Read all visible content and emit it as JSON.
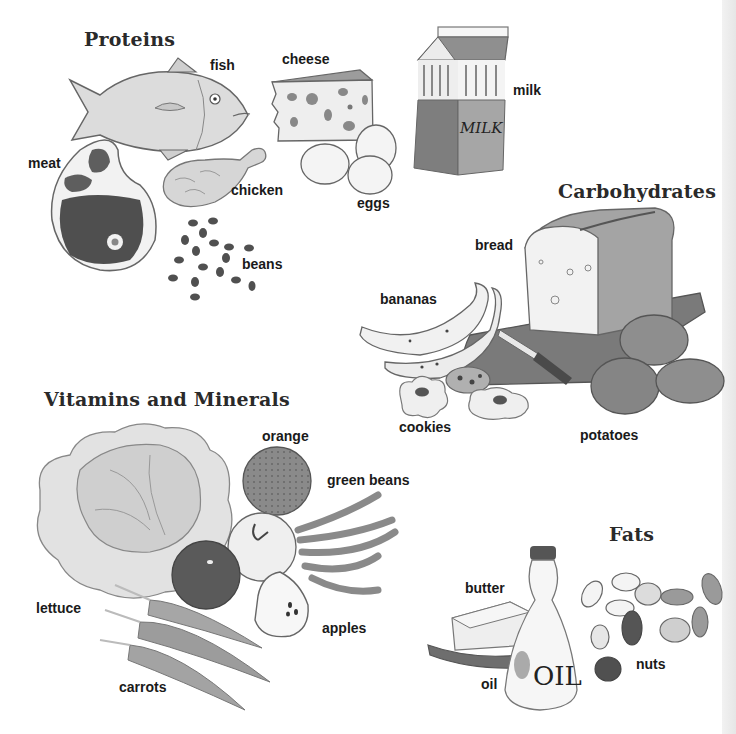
{
  "figure": {
    "groups": [
      {
        "id": "proteins",
        "heading": "Proteins",
        "items": [
          "fish",
          "cheese",
          "milk",
          "meat",
          "chicken",
          "eggs",
          "beans"
        ]
      },
      {
        "id": "carbohydrates",
        "heading": "Carbohydrates",
        "items": [
          "bread",
          "bananas",
          "cookies",
          "potatoes"
        ]
      },
      {
        "id": "vitamins_minerals",
        "heading": "Vitamins and Minerals",
        "items": [
          "orange",
          "green beans",
          "lettuce",
          "apples",
          "carrots"
        ]
      },
      {
        "id": "fats",
        "heading": "Fats",
        "items": [
          "butter",
          "oil",
          "nuts"
        ]
      }
    ]
  },
  "headings": {
    "proteins": "Proteins",
    "carbohydrates": "Carbohydrates",
    "vitamins": "Vitamins and Minerals",
    "fats": "Fats"
  },
  "labels": {
    "fish": "fish",
    "cheese": "cheese",
    "milk": "milk",
    "meat": "meat",
    "chicken": "chicken",
    "eggs": "eggs",
    "beans": "beans",
    "bread": "bread",
    "bananas": "bananas",
    "cookies": "cookies",
    "potatoes": "potatoes",
    "orange": "orange",
    "green_beans": "green beans",
    "lettuce": "lettuce",
    "apples": "apples",
    "carrots": "carrots",
    "butter": "butter",
    "oil": "oil",
    "nuts": "nuts"
  },
  "carton_text": "MILK",
  "bottle_text": "OIL",
  "colors": {
    "ink": "#1a1a1a",
    "outline": "#555555",
    "dark_fill": "#5a5a5a",
    "mid_fill": "#9a9a9a",
    "light_fill": "#d8d8d8",
    "paper": "#ffffff"
  }
}
